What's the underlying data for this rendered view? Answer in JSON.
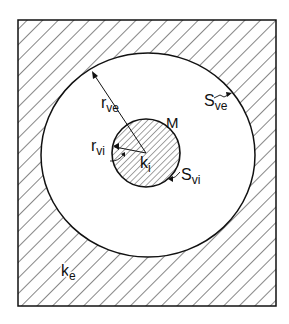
{
  "diagram": {
    "labels": {
      "r_ve": {
        "main": "r",
        "sub": "ve"
      },
      "r_vi": {
        "main": "r",
        "sub": "vi"
      },
      "M": "M",
      "k_i": {
        "main": "k",
        "sub": "i"
      },
      "S_vi": {
        "main": "S",
        "sub": "vi"
      },
      "S_ve": {
        "main": "S",
        "sub": "ve"
      },
      "k_e": {
        "main": "k",
        "sub": "e"
      }
    },
    "colors": {
      "line": "#111111",
      "background": "#ffffff"
    }
  }
}
